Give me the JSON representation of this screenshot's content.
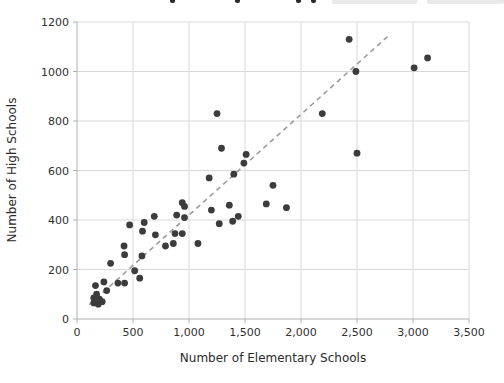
{
  "chart_data": {
    "type": "scatter",
    "title": "",
    "xlabel": "Number of Elementary Schools",
    "ylabel": "Number of High Schools",
    "xlim": [
      0,
      3500
    ],
    "ylim": [
      0,
      1200
    ],
    "grid": true,
    "x_ticks": [
      0,
      500,
      1000,
      1500,
      2000,
      2500,
      3000,
      3500
    ],
    "x_tick_labels": [
      "0",
      "500",
      "1,000",
      "1,500",
      "2,000",
      "2,500",
      "3,000",
      "3,500"
    ],
    "y_ticks": [
      0,
      200,
      400,
      600,
      800,
      1000,
      1200
    ],
    "y_tick_labels": [
      "0",
      "200",
      "400",
      "600",
      "800",
      "1000",
      "1200"
    ],
    "points": [
      [
        150,
        65
      ],
      [
        190,
        60
      ],
      [
        200,
        80
      ],
      [
        150,
        85
      ],
      [
        225,
        70
      ],
      [
        175,
        100
      ],
      [
        265,
        115
      ],
      [
        165,
        135
      ],
      [
        240,
        150
      ],
      [
        365,
        145
      ],
      [
        425,
        145
      ],
      [
        560,
        165
      ],
      [
        515,
        195
      ],
      [
        300,
        225
      ],
      [
        580,
        255
      ],
      [
        425,
        260
      ],
      [
        420,
        295
      ],
      [
        790,
        295
      ],
      [
        860,
        305
      ],
      [
        1080,
        305
      ],
      [
        700,
        340
      ],
      [
        875,
        345
      ],
      [
        940,
        345
      ],
      [
        585,
        355
      ],
      [
        470,
        380
      ],
      [
        600,
        390
      ],
      [
        1270,
        385
      ],
      [
        1390,
        395
      ],
      [
        890,
        420
      ],
      [
        960,
        410
      ],
      [
        690,
        415
      ],
      [
        1440,
        415
      ],
      [
        1200,
        440
      ],
      [
        940,
        470
      ],
      [
        960,
        455
      ],
      [
        1360,
        460
      ],
      [
        1180,
        570
      ],
      [
        1400,
        585
      ],
      [
        1690,
        465
      ],
      [
        1870,
        450
      ],
      [
        1750,
        540
      ],
      [
        1490,
        630
      ],
      [
        1510,
        665
      ],
      [
        1290,
        690
      ],
      [
        2500,
        670
      ],
      [
        1250,
        830
      ],
      [
        2190,
        830
      ],
      [
        2490,
        1000
      ],
      [
        2430,
        1130
      ],
      [
        3010,
        1015
      ],
      [
        3130,
        1055
      ]
    ],
    "trendline": {
      "style": "dashed",
      "x1": 110,
      "y1": 58,
      "x2": 2780,
      "y2": 1144
    },
    "colors": {
      "point": "#3c3c3c",
      "trendline": "#9c9c9c",
      "grid": "#d9d9d9",
      "axis": "#b0b0b0",
      "tick_label": "#303030",
      "axis_label": "#2b2b2b",
      "header_fragment": "#2a2a2a",
      "header_highlight": "#e9e9e9"
    }
  }
}
